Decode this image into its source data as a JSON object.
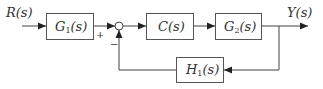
{
  "diagram": {
    "type": "block-diagram",
    "input": {
      "label": "R(s)"
    },
    "output": {
      "label": "Y(s)"
    },
    "blocks": [
      {
        "id": "G1",
        "name": "G",
        "sub": "1",
        "arg": "(s)"
      },
      {
        "id": "C",
        "name": "C",
        "sub": "",
        "arg": "(s)"
      },
      {
        "id": "G2",
        "name": "G",
        "sub": "2",
        "arg": "(s)"
      },
      {
        "id": "H1",
        "name": "H",
        "sub": "1",
        "arg": "(s)"
      }
    ],
    "summing_junction": {
      "plus_sign": "+",
      "minus_sign": "−"
    },
    "connections": [
      "R(s) -> G1",
      "G1 -> sum(+)",
      "sum -> C",
      "C -> G2",
      "G2 -> Y(s)",
      "Y(s) -> H1",
      "H1 -> sum(−)"
    ]
  }
}
